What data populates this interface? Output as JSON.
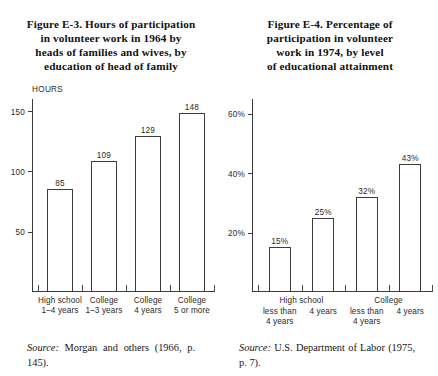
{
  "figures": [
    {
      "id": "figure-e-3",
      "title_lines": [
        "Figure E-3. Hours of participation",
        "in volunteer work in 1964 by",
        "heads of families and wives, by",
        "education of head of family"
      ],
      "source_word": "Source:",
      "source_body": " Morgan and others (1966, p. 145).",
      "chart_data": {
        "type": "bar",
        "title": "Figure E-3. Hours of participation in volunteer work in 1964 by heads of families and wives, by education of head of family",
        "xlabel": "",
        "ylabel": "HOURS",
        "ylim": [
          0,
          160
        ],
        "yticks": [
          50,
          100,
          150
        ],
        "ytick_labels": [
          "50",
          "100",
          "150"
        ],
        "grid": false,
        "legend": "none",
        "categories": [
          [
            "High school",
            "1–4 years"
          ],
          [
            "College",
            "1–3 years"
          ],
          [
            "College",
            "4 years"
          ],
          [
            "College",
            "5 or more"
          ]
        ],
        "values": [
          85,
          109,
          129,
          148
        ],
        "value_labels": [
          "85",
          "109",
          "129",
          "148"
        ]
      }
    },
    {
      "id": "figure-e-4",
      "title_lines": [
        "Figure E-4. Percentage of",
        "participation in volunteer",
        "work in 1974, by level",
        "of educational attainment"
      ],
      "source_word": "Source:",
      "source_body": " U.S. Department of Labor (1975, p. 7).",
      "group_labels": [
        "High school",
        "College"
      ],
      "chart_data": {
        "type": "bar",
        "title": "Figure E-4. Percentage of participation in volunteer work in 1974, by level of educational attainment",
        "xlabel": "",
        "ylabel": "",
        "ylim": [
          0,
          65
        ],
        "yticks": [
          20,
          40,
          60
        ],
        "ytick_labels": [
          "20%",
          "40%",
          "60%"
        ],
        "grid": false,
        "legend": "none",
        "categories": [
          [
            "less than",
            "4 years"
          ],
          [
            "4 years"
          ],
          [
            "less than",
            "4 years"
          ],
          [
            "4 years"
          ]
        ],
        "values": [
          15,
          25,
          32,
          43
        ],
        "value_labels": [
          "15%",
          "25%",
          "32%",
          "43%"
        ]
      }
    }
  ]
}
